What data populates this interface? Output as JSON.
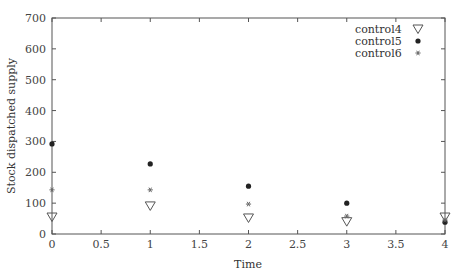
{
  "chart_data": {
    "type": "scatter",
    "title": "",
    "xlabel": "Time",
    "ylabel": "Stock dispatched supply",
    "xlim": [
      0,
      4
    ],
    "ylim": [
      0,
      700
    ],
    "xticks": [
      0,
      0.5,
      1,
      1.5,
      2,
      2.5,
      3,
      3.5,
      4
    ],
    "xtick_labels": [
      "0",
      "0.5",
      "1",
      "1.5",
      "2",
      "2.5",
      "3",
      "3.5",
      "4"
    ],
    "yticks": [
      0,
      100,
      200,
      300,
      400,
      500,
      600,
      700
    ],
    "ytick_labels": [
      "0",
      "100",
      "200",
      "300",
      "400",
      "500",
      "600",
      "700"
    ],
    "grid": false,
    "legend_position": "upper right",
    "x": [
      0,
      1,
      2,
      3,
      4
    ],
    "series": [
      {
        "name": "control4",
        "marker": "triangle-down-open",
        "values": [
          55,
          91,
          52,
          40,
          55
        ]
      },
      {
        "name": "control5",
        "marker": "filled-circle",
        "values": [
          292,
          227,
          155,
          100,
          38
        ]
      },
      {
        "name": "control6",
        "marker": "star",
        "values": [
          143,
          143,
          97,
          58,
          45
        ]
      }
    ]
  },
  "colors": {
    "axis": "#555555",
    "marker": "#222222",
    "star": "#666666"
  }
}
